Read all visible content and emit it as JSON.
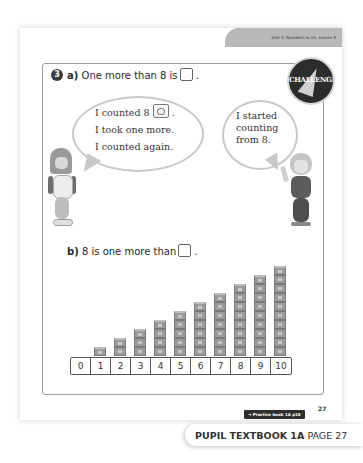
{
  "header": {
    "unit_label": "Unit 1: Numbers to 10, Lesson 5",
    "badge": "CHALLENGE"
  },
  "question": {
    "number": "3",
    "part_a": {
      "label": "a)",
      "text": "One more than 8 is",
      "end": "."
    },
    "speech_left": {
      "line1": "I counted 8",
      "line1_end": ".",
      "line2": "I took one more.",
      "line3": "I counted again."
    },
    "speech_right": {
      "line1": "I started",
      "line2": "counting",
      "line3": "from 8."
    },
    "part_b": {
      "label": "b)",
      "text": "8 is one more than",
      "end": "."
    }
  },
  "number_line": [
    "0",
    "1",
    "2",
    "3",
    "4",
    "5",
    "6",
    "7",
    "8",
    "9",
    "10"
  ],
  "cube_stacks": [
    1,
    2,
    3,
    4,
    5,
    6,
    7,
    8,
    9,
    10
  ],
  "footer": {
    "page_number": "27",
    "practice_link": "→ Practice book 1A p18",
    "book_title": "PUPIL TEXTBOOK 1A",
    "page_label": "PAGE 27"
  },
  "colors": {
    "cube": "#9c9c9c",
    "dark_badge": "#2c2c2c",
    "tab_gray": "#b9b9b9"
  }
}
